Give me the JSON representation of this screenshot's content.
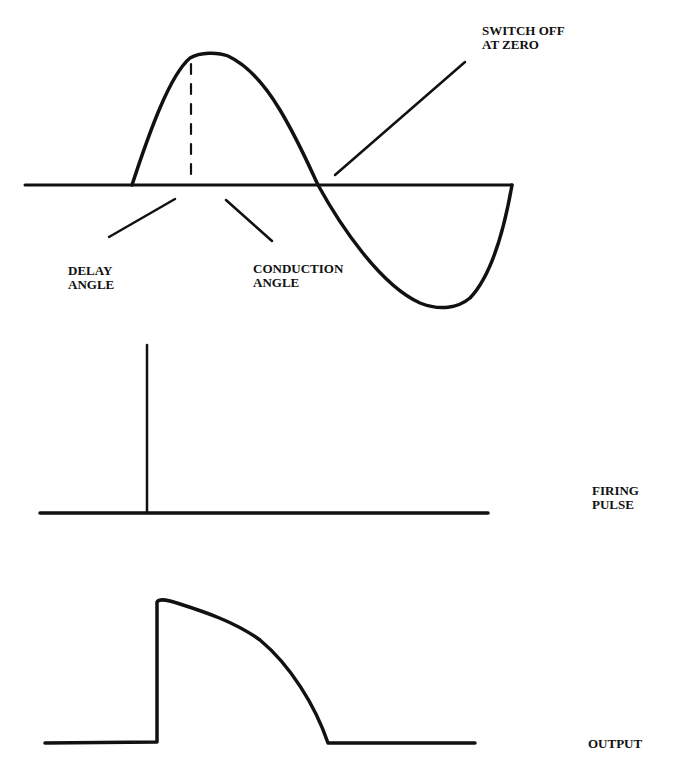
{
  "diagram": {
    "colors": {
      "ink": "#111111",
      "background": "#ffffff"
    },
    "panels": [
      {
        "id": "supply",
        "labels": {
          "switch_off_line1": "SWITCH OFF",
          "switch_off_line2": "AT ZERO",
          "delay_line1": "DELAY",
          "delay_line2": "ANGLE",
          "conduction_line1": "CONDUCTION",
          "conduction_line2": "ANGLE"
        }
      },
      {
        "id": "firing",
        "labels": {
          "line1": "FIRING",
          "line2": "PULSE"
        }
      },
      {
        "id": "output",
        "labels": {
          "line1": "OUTPUT"
        }
      }
    ]
  }
}
